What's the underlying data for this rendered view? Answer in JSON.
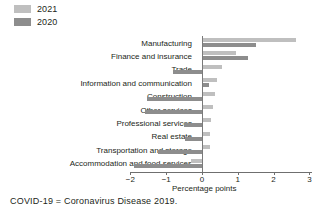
{
  "chart_data": {
    "type": "bar",
    "orientation": "horizontal",
    "title": "",
    "xlabel": "Percentage points",
    "ylabel": "",
    "xlim": [
      -2,
      3
    ],
    "xticks": [
      -2,
      -1,
      0,
      1,
      2,
      3
    ],
    "xtick_labels": [
      "−2",
      "−1",
      "0",
      "1",
      "2",
      "3"
    ],
    "grid": false,
    "legend_position": "top-left",
    "categories": [
      "Manufacturing",
      "Finance and insurance",
      "Trade",
      "Information and communication",
      "Construction",
      "Other services",
      "Professional services",
      "Real estate",
      "Transportation and storage",
      "Accommodation and food services"
    ],
    "series": [
      {
        "name": "2021",
        "color": "#bfbfbf",
        "values": [
          2.62,
          0.95,
          0.55,
          0.42,
          0.35,
          0.3,
          0.25,
          0.22,
          0.22,
          -0.3
        ]
      },
      {
        "name": "2020",
        "color": "#8d8d8d",
        "values": [
          1.5,
          1.28,
          -0.82,
          0.2,
          -1.55,
          -1.58,
          -0.5,
          -0.48,
          -1.22,
          -1.9
        ]
      }
    ]
  },
  "legend": {
    "items": [
      {
        "label": "2021",
        "color": "#bfbfbf"
      },
      {
        "label": "2020",
        "color": "#8d8d8d"
      }
    ]
  },
  "axis": {
    "xlabel": "Percentage points",
    "tick_labels": [
      "−2",
      "−1",
      "0",
      "1",
      "2",
      "3"
    ]
  },
  "footnote": "COVID-19 = Coronavirus Disease 2019."
}
